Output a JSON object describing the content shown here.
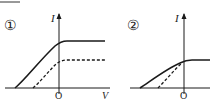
{
  "panels": [
    {
      "label": "①",
      "y_axis_label": "I",
      "x_axis_label": "V",
      "origin_label": "O",
      "curves": [
        {
          "name": "solid",
          "style": "solid",
          "start_x": 15,
          "knee": [
            65,
            41
          ],
          "plateau_end": 105
        },
        {
          "name": "dashed",
          "style": "dashed",
          "start_x": 33,
          "knee": [
            65,
            60
          ],
          "plateau_end": 105
        }
      ]
    },
    {
      "label": "②",
      "y_axis_label": "I",
      "x_axis_label": "",
      "origin_label": "O",
      "curves": [
        {
          "name": "solid",
          "style": "solid",
          "start_x": 140,
          "knee": [
            190,
            60
          ],
          "plateau_end": 210
        },
        {
          "name": "dashed",
          "style": "dashed",
          "start_x": 158,
          "knee": [
            184,
            62
          ],
          "plateau_end": 210
        }
      ]
    }
  ],
  "colors": {
    "line": "#1a1a1a",
    "text": "#222222"
  }
}
